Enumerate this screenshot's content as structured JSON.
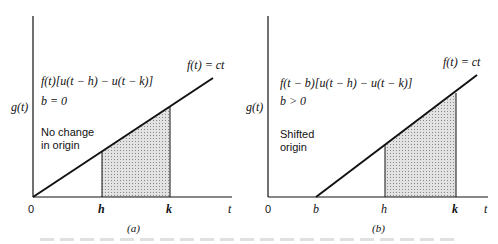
{
  "panel_a": {
    "ylabel": "g(t)",
    "line_label": "f(t) = ct",
    "expr": "f(t)[u(t − h) − u(t − k)]",
    "param": "b = 0",
    "note_line1": "No change",
    "note_line2": "in origin",
    "ticks": {
      "origin": "0",
      "h": "h",
      "k": "k",
      "t": "t"
    },
    "caption": "(a)"
  },
  "panel_b": {
    "ylabel": "g(t)",
    "line_label": "f(t) = ct",
    "expr": "f(t − b)[u(t − h) − u(t − k)]",
    "param": "b > 0",
    "note_line1": "Shifted",
    "note_line2": "origin",
    "ticks": {
      "origin": "0",
      "b": "b",
      "h": "h",
      "k": "k",
      "t": "t"
    },
    "caption": "(b)"
  },
  "colors": {
    "ink": "#111111",
    "shade": "#c8c8c8"
  }
}
